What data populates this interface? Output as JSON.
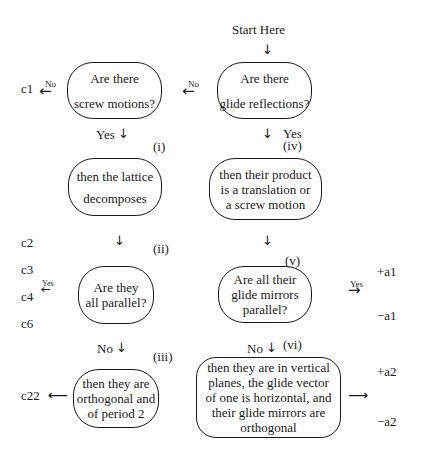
{
  "start": {
    "label": "Start Here"
  },
  "arrows": {
    "down": "↓",
    "left": "←",
    "right": "→",
    "long_left": "⟵",
    "long_right": "⟶"
  },
  "edge_labels": {
    "no": "No",
    "yes": "Yes"
  },
  "nodes": {
    "glide": {
      "id": "(iv)",
      "lines": [
        "Are there",
        "glide reflections?"
      ]
    },
    "screw": {
      "lines": [
        "Are there",
        "screw motions?"
      ]
    },
    "lattice": {
      "id": "(i)",
      "lines": [
        "then the lattice",
        "decomposes"
      ]
    },
    "product": {
      "lines": [
        "then their product",
        "is a translation or",
        "a screw motion"
      ]
    },
    "screw_parallel": {
      "id": "(ii)",
      "lines": [
        "Are they",
        "all parallel?"
      ]
    },
    "mirrors_parallel": {
      "id": "(v)",
      "lines": [
        "Are all their",
        "glide mirrors",
        "parallel?"
      ]
    },
    "orthogonal": {
      "id": "(iii)",
      "lines": [
        "then they are",
        "orthogonal and",
        "of period 2"
      ]
    },
    "vertical": {
      "id": "(vi)",
      "lines": [
        "then they are in vertical",
        "planes, the glide vector",
        "of one is horizontal, and",
        "their glide mirrors are",
        "orthogonal"
      ]
    }
  },
  "outcomes": {
    "left": [
      "c1",
      "c2",
      "c3",
      "c4",
      "c6",
      "c22"
    ],
    "right": [
      "+a1",
      "−a1",
      "+a2",
      "−a2"
    ]
  }
}
